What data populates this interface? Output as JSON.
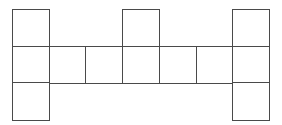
{
  "diagram": {
    "type": "cube-net-like grid of squares",
    "grid": {
      "origin_x": 12,
      "origin_y": 9,
      "cell_size": 36.7,
      "columns": 7,
      "rows": 3
    },
    "line_color": "#4a4a4a",
    "background": "#ffffff",
    "cells": [
      {
        "row": 0,
        "col": 0
      },
      {
        "row": 0,
        "col": 3
      },
      {
        "row": 0,
        "col": 6
      },
      {
        "row": 1,
        "col": 0
      },
      {
        "row": 1,
        "col": 1
      },
      {
        "row": 1,
        "col": 2
      },
      {
        "row": 1,
        "col": 3
      },
      {
        "row": 1,
        "col": 4
      },
      {
        "row": 1,
        "col": 5
      },
      {
        "row": 1,
        "col": 6
      },
      {
        "row": 2,
        "col": 0
      },
      {
        "row": 2,
        "col": 6
      }
    ]
  }
}
